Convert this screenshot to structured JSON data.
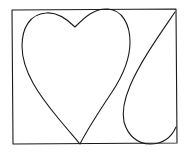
{
  "drawing": {
    "stroke_color": "#1a1a1a",
    "background": "#ffffff",
    "shapes": [
      "frame-rectangle",
      "heart",
      "teardrop"
    ]
  }
}
